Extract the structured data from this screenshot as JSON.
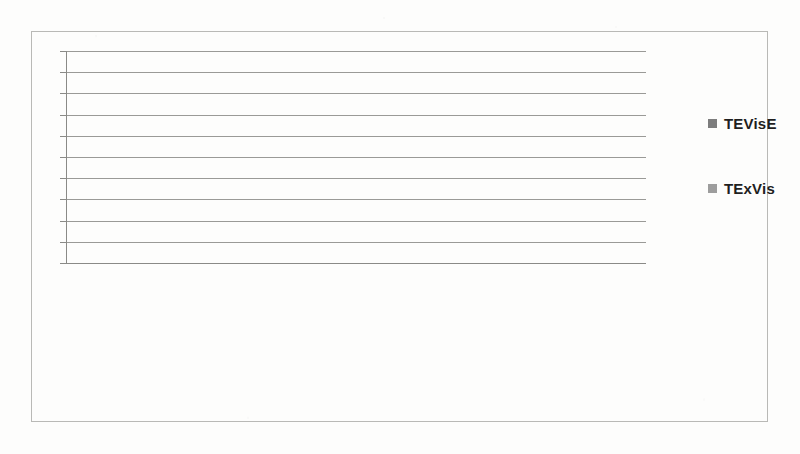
{
  "chart_data": {
    "type": "bar",
    "title": "",
    "subtitle": "",
    "xlabel": "",
    "ylabel": "",
    "ylim": [
      0,
      10
    ],
    "y_ticks": [
      0,
      1,
      2,
      3,
      4,
      5,
      6,
      7,
      8,
      9,
      10
    ],
    "grid": true,
    "legend_position": "right",
    "categories": [
      "Instrinic",
      "Extraneous",
      "Germane",
      "Instrinic",
      "Extraneous",
      "Germane",
      "Instrinic",
      "Extraneous",
      "Germane",
      "Instrinic",
      "Extraneous",
      "Germane"
    ],
    "groups": [
      {
        "label": "Overview",
        "categories": [
          "Instrinic",
          "Extraneous",
          "Germane"
        ]
      },
      {
        "label": "Adjust",
        "categories": [
          "Instrinic",
          "Extraneous",
          "Germane"
        ]
      },
      {
        "label": "Detect Pattern",
        "categories": [
          "Instrinic",
          "Extraneous",
          "Germane"
        ]
      },
      {
        "label": "Match Mental\nModels",
        "categories": [
          "Instrinic",
          "Extraneous",
          "Germane"
        ]
      }
    ],
    "series": [
      {
        "name": "TEVisE",
        "color": "#7d7d7d",
        "values": [
          2.15,
          2.65,
          6.8,
          3.1,
          3.1,
          7.45,
          2.4,
          2.5,
          8.2,
          3.75,
          3.75,
          8.0
        ]
      },
      {
        "name": "TExVis",
        "color": "#9d9d9d",
        "values": [
          2.15,
          1.8,
          7.15,
          2.85,
          2.85,
          7.55,
          2.65,
          2.6,
          8.0,
          4.1,
          3.45,
          8.35
        ]
      }
    ]
  },
  "legend": {
    "items": [
      {
        "label": "TEVisE",
        "color": "#7d7d7d"
      },
      {
        "label": "TExVis",
        "color": "#9d9d9d"
      }
    ]
  },
  "axis": {
    "y_labels": [
      "10",
      "9",
      "8",
      "7",
      "6",
      "5",
      "4",
      "3",
      "2",
      "1",
      "0"
    ]
  }
}
